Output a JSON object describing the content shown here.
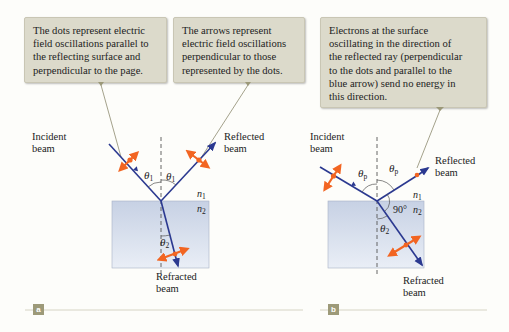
{
  "callouts": {
    "dots": {
      "lines": [
        "The dots represent electric",
        "field oscillations parallel to",
        "the reflecting surface and",
        "perpendicular to the page."
      ]
    },
    "arrows": {
      "lines": [
        "The arrows represent",
        "electric field oscillations",
        "perpendicular to those",
        "represented by the dots."
      ]
    },
    "electrons": {
      "lines": [
        "Electrons at the surface",
        "oscillating in the direction of",
        "the reflected ray (perpendicular",
        "to the dots and parallel to the",
        "blue arrow) send no energy in",
        "this direction."
      ]
    }
  },
  "panel_a": {
    "tag": "a",
    "incident": [
      "Incident",
      "beam"
    ],
    "reflected": [
      "Reflected",
      "beam"
    ],
    "refracted": [
      "Refracted",
      "beam"
    ],
    "angle_incident": {
      "symbol": "θ",
      "sub": "1"
    },
    "angle_reflected": {
      "symbol": "θ",
      "sub": "1"
    },
    "angle_refracted": {
      "symbol": "θ",
      "sub": "2"
    },
    "n1": {
      "symbol": "n",
      "sub": "1"
    },
    "n2": {
      "symbol": "n",
      "sub": "2"
    }
  },
  "panel_b": {
    "tag": "b",
    "incident": [
      "Incident",
      "beam"
    ],
    "reflected": [
      "Reflected",
      "beam"
    ],
    "refracted": [
      "Refracted",
      "beam"
    ],
    "angle_incident": {
      "symbol": "θ",
      "sub": "p"
    },
    "angle_reflected": {
      "symbol": "θ",
      "sub": "p"
    },
    "angle_refracted": {
      "symbol": "θ",
      "sub": "2"
    },
    "right_angle": "90°",
    "n1": {
      "symbol": "n",
      "sub": "1"
    },
    "n2": {
      "symbol": "n",
      "sub": "2"
    }
  },
  "colors": {
    "ray": "#2b3990",
    "polarization": "#f26522",
    "callout_bg": "#dcdacb",
    "glass_top": "#c9d3e6",
    "glass_bottom": "#e8edf5",
    "leader": "#8d8a6e",
    "tag_bg": "#9d9a79",
    "rule": "#d6d4c4"
  }
}
